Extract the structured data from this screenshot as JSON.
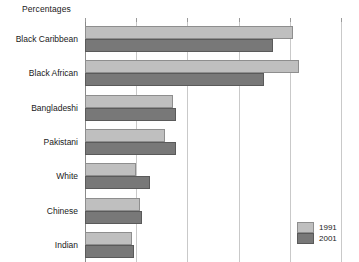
{
  "chart_data": {
    "type": "bar",
    "orientation": "horizontal",
    "title": "Percentages",
    "xlabel": "",
    "ylabel": "",
    "xlim": [
      0,
      50
    ],
    "grid": true,
    "gridline_values": [
      0,
      10,
      20,
      30,
      40,
      50
    ],
    "legend_position": "bottom-right",
    "categories": [
      "Black Caribbean",
      "Black African",
      "Bangladeshi",
      "Pakistani",
      "White",
      "Chinese",
      "Indian"
    ],
    "series": [
      {
        "name": "1991",
        "color": "#bfbfbf",
        "values": [
          40.6,
          41.8,
          17.1,
          15.7,
          10.0,
          10.8,
          9.2
        ]
      },
      {
        "name": "2001",
        "color": "#787878",
        "values": [
          36.7,
          34.9,
          17.8,
          17.8,
          12.7,
          11.2,
          9.6
        ]
      }
    ]
  },
  "legend": {
    "items": [
      {
        "label": "1991",
        "swatch": "light-gray-swatch"
      },
      {
        "label": "2001",
        "swatch": "dark-gray-swatch"
      }
    ]
  },
  "colors": {
    "series_1991": "#bfbfbf",
    "series_2001": "#787878",
    "gridline": "#c9c9c9",
    "axis": "#8a8a8a",
    "text": "#1a1a1a",
    "background": "#ffffff"
  }
}
